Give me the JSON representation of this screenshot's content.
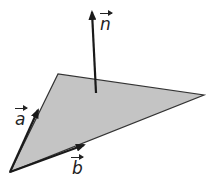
{
  "diagram": {
    "colors": {
      "plane_fill": "#c4c4c4",
      "stroke": "#1a1a1a",
      "background": "#ffffff"
    },
    "plane": {
      "vertices": [
        [
          10,
          172
        ],
        [
          58,
          74
        ],
        [
          204,
          95
        ]
      ]
    },
    "vectors": [
      {
        "id": "a",
        "label": "a",
        "from": [
          10,
          172
        ],
        "to": [
          38,
          110
        ]
      },
      {
        "id": "b",
        "label": "b",
        "from": [
          10,
          172
        ],
        "to": [
          84,
          145
        ]
      },
      {
        "id": "n",
        "label": "n",
        "from": [
          96,
          93
        ],
        "to": [
          92,
          12
        ]
      }
    ]
  }
}
